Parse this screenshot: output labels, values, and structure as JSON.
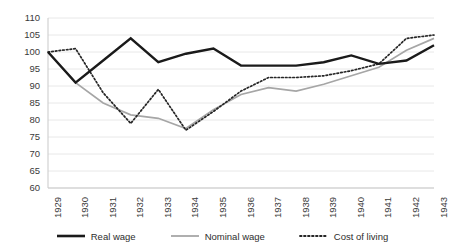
{
  "chart_data": {
    "type": "line",
    "title": "",
    "xlabel": "",
    "ylabel": "",
    "categories": [
      "1929",
      "1930",
      "1931",
      "1932",
      "1933",
      "1934",
      "1935",
      "1936",
      "1937",
      "1938",
      "1939",
      "1940",
      "1941",
      "1942",
      "1943"
    ],
    "ylim": [
      60,
      110
    ],
    "ytick_step": 5,
    "yticks": [
      110,
      105,
      100,
      95,
      90,
      85,
      80,
      75,
      70,
      65,
      60
    ],
    "grid": true,
    "grid_axis": "y",
    "legend_position": "bottom",
    "series": [
      {
        "name": "Real wage",
        "style": "solid-thick",
        "color": "#1a1a1a",
        "values": [
          100,
          91,
          97.5,
          104,
          97,
          99.5,
          101,
          96,
          96,
          96,
          97,
          99,
          96.5,
          97.5,
          102
        ]
      },
      {
        "name": "Nominal wage",
        "style": "solid",
        "color": "#a6a6a6",
        "values": [
          100,
          91,
          85,
          81.5,
          80.5,
          77.5,
          83,
          87.5,
          89.5,
          88.5,
          90.5,
          93,
          95.5,
          100.5,
          104
        ]
      },
      {
        "name": "Cost of living",
        "style": "dotted",
        "color": "#262626",
        "values": [
          100,
          101,
          88,
          79,
          89,
          77,
          82.5,
          88.5,
          92.5,
          92.5,
          93,
          94.5,
          96.5,
          104,
          105
        ]
      }
    ]
  },
  "legend": {
    "items": [
      {
        "label": "Real wage",
        "key": "real-wage"
      },
      {
        "label": "Nominal wage",
        "key": "nominal-wage"
      },
      {
        "label": "Cost of living",
        "key": "cost-of-living"
      }
    ]
  },
  "axes": {
    "y_axis_name": "value-axis",
    "x_axis_name": "year-axis"
  }
}
